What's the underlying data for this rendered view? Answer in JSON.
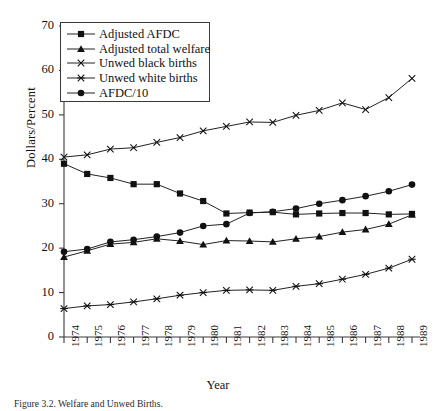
{
  "chart_data": {
    "type": "line",
    "title": "",
    "xlabel": "Year",
    "ylabel": "Dollars/Percent",
    "categories": [
      "1974",
      "1975",
      "1976",
      "1977",
      "1978",
      "1979",
      "1980",
      "1981",
      "1982",
      "1983",
      "1984",
      "1985",
      "1986",
      "1987",
      "1988",
      "1989"
    ],
    "xlim": [
      1974,
      1989
    ],
    "ylim": [
      0,
      70
    ],
    "yticks": [
      0,
      10,
      20,
      30,
      40,
      50,
      60,
      70
    ],
    "grid": false,
    "legend_position": "top-left",
    "series": [
      {
        "name": "Adjusted AFDC",
        "marker": "square",
        "values": [
          39.0,
          36.7,
          35.8,
          34.4,
          34.4,
          32.3,
          30.6,
          27.8,
          28.0,
          28.1,
          27.6,
          27.8,
          27.9,
          27.9,
          27.6,
          27.7
        ]
      },
      {
        "name": "Adjusted total welfare",
        "marker": "triangle",
        "values": [
          18.0,
          19.4,
          20.9,
          21.3,
          22.1,
          21.6,
          20.8,
          21.7,
          21.6,
          21.4,
          22.1,
          22.6,
          23.6,
          24.2,
          25.4,
          27.5
        ]
      },
      {
        "name": "Unwed black births",
        "marker": "x",
        "values": [
          40.5,
          41.0,
          42.3,
          42.6,
          43.8,
          44.9,
          46.4,
          47.4,
          48.4,
          48.3,
          49.9,
          51.0,
          52.7,
          51.2,
          53.9,
          55.0
        ]
      },
      {
        "name": "Unwed white births",
        "marker": "asterisk",
        "values": [
          6.4,
          7.0,
          7.3,
          7.9,
          8.6,
          9.4,
          10.0,
          10.5,
          10.6,
          10.5,
          11.4,
          12.0,
          13.0,
          14.1,
          15.5,
          17.5
        ]
      },
      {
        "name": "AFDC/10",
        "marker": "circle",
        "values": [
          19.2,
          19.8,
          21.4,
          21.9,
          22.6,
          23.5,
          25.0,
          25.4,
          27.9,
          28.2,
          28.9,
          30.0,
          30.8,
          31.7,
          32.8,
          34.3
        ]
      }
    ],
    "series_1989_extra": {
      "Unwed black births": 58.2
    }
  },
  "caption": {
    "text": "Figure 3.2. Welfare and Unwed Births."
  }
}
